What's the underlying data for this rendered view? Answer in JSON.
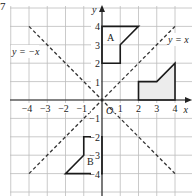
{
  "question_number": "7",
  "axes": {
    "x_label": "x",
    "y_label": "y",
    "origin_label": "O",
    "x_ticks": [
      "−4",
      "−3",
      "−2",
      "−1",
      "1",
      "2",
      "3",
      "4"
    ],
    "y_ticks": [
      "4",
      "3",
      "2",
      "1",
      "−1",
      "−2",
      "−3",
      "−4"
    ],
    "range": {
      "x": [
        -5,
        5
      ],
      "y": [
        -5,
        5
      ]
    }
  },
  "lines": [
    {
      "label": "y = −x",
      "from": [
        -4,
        4
      ],
      "to": [
        4,
        -4
      ],
      "style": "dashed"
    },
    {
      "label": "y = x",
      "from": [
        -4,
        -4
      ],
      "to": [
        4,
        4
      ],
      "style": "dashed"
    }
  ],
  "shapes": [
    {
      "name": "shaded",
      "label": "",
      "vertices": [
        [
          2,
          0
        ],
        [
          2,
          1
        ],
        [
          3,
          1
        ],
        [
          4,
          2
        ],
        [
          4,
          0
        ]
      ],
      "fill": "#ececec"
    },
    {
      "name": "A",
      "label": "A",
      "vertices": [
        [
          0,
          4
        ],
        [
          2,
          4
        ],
        [
          1,
          3
        ],
        [
          1,
          2
        ],
        [
          0,
          2
        ]
      ],
      "fill": "none"
    },
    {
      "name": "B",
      "label": "B",
      "vertices": [
        [
          -1,
          -2
        ],
        [
          0,
          -2
        ],
        [
          0,
          -4
        ],
        [
          -2,
          -4
        ],
        [
          -1,
          -3
        ]
      ],
      "fill": "none"
    }
  ],
  "colors": {
    "grid": "#bdbdbd",
    "axis": "#222222",
    "shape_stroke": "#1a1a1a",
    "shaded_fill": "#ececec",
    "text": "#222222"
  }
}
